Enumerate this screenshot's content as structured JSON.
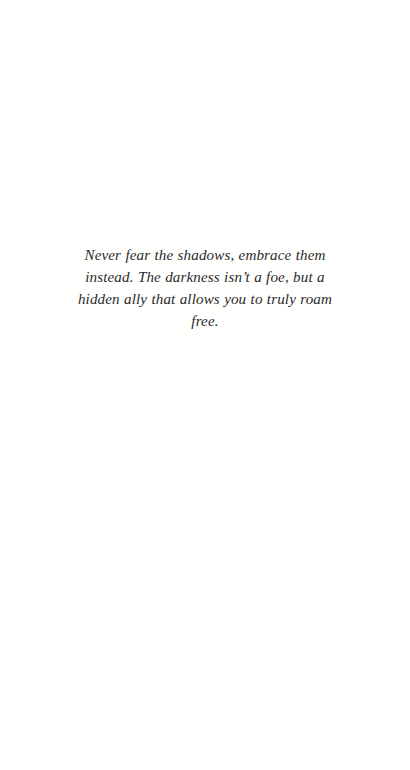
{
  "page": {
    "background_color": "#fffffe",
    "kind": "printed-book-page-scan"
  },
  "quote": {
    "text": "Never fear the shadows, embrace them instead. The darkness isn’t a foe, but a hidden ally that allows you to truly roam free.",
    "line_1": "Never fear the shadows, embrace them instead. The darkness",
    "line_2": "isn’t a foe, but a hidden ally that allows you to truly roam free.",
    "color": "#2a2a2a",
    "style": "italic",
    "alignment": "center"
  }
}
